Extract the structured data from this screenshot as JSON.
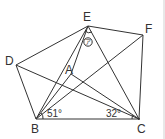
{
  "diagram": {
    "points": {
      "E": {
        "label": "E",
        "x": 88,
        "y": 26
      },
      "F": {
        "label": "F",
        "x": 143,
        "y": 35
      },
      "D": {
        "label": "D",
        "x": 16,
        "y": 65
      },
      "A": {
        "label": "A",
        "x": 71,
        "y": 74
      },
      "B": {
        "label": "B",
        "x": 36,
        "y": 119
      },
      "C": {
        "label": "C",
        "x": 139,
        "y": 119
      }
    },
    "angles": {
      "B": "51°",
      "C": "32°",
      "E_mark": "ア"
    },
    "segments": [
      "D-E",
      "E-F",
      "F-C",
      "C-B",
      "B-D",
      "D-C",
      "B-E",
      "B-F",
      "B-A",
      "E-C",
      "A-C"
    ]
  }
}
